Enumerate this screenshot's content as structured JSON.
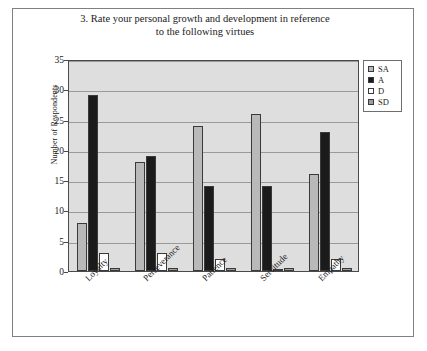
{
  "figure": {
    "title_line1": "3. Rate your personal growth and development in reference",
    "title_line2": "to the following virtues"
  },
  "legend": {
    "entries": [
      {
        "label": "SA",
        "color": "#b9b9b9",
        "swatch": "sa"
      },
      {
        "label": "A",
        "color": "#1b1b1b",
        "swatch": "a"
      },
      {
        "label": "D",
        "color": "#ffffff",
        "swatch": "d"
      },
      {
        "label": "SD",
        "color": "#9d9d9d",
        "swatch": "sd"
      }
    ]
  },
  "axes": {
    "ylabel": "Number of Respondents",
    "yticks": [
      "0",
      "5",
      "10",
      "15",
      "20",
      "25",
      "30",
      "35"
    ]
  },
  "chart_data": {
    "type": "bar",
    "title": "3. Rate your personal growth and development in reference to the following virtues",
    "xlabel": "",
    "ylabel": "Number of Respondents",
    "ylim": [
      0,
      35
    ],
    "ytick_step": 5,
    "grid": true,
    "legend_position": "right",
    "categories": [
      "Loyalty",
      "Perseverance",
      "Patience",
      "Servitude",
      "Empathy"
    ],
    "series": [
      {
        "name": "SA",
        "color": "#b9b9b9",
        "values": [
          8,
          18,
          24,
          26,
          16
        ]
      },
      {
        "name": "A",
        "color": "#1b1b1b",
        "values": [
          29,
          19,
          14,
          14,
          23
        ]
      },
      {
        "name": "D",
        "color": "#ffffff",
        "values": [
          3,
          3,
          2,
          0.4,
          2
        ]
      },
      {
        "name": "SD",
        "color": "#9d9d9d",
        "values": [
          0.5,
          0.5,
          0.5,
          0.5,
          0.5
        ]
      }
    ]
  }
}
